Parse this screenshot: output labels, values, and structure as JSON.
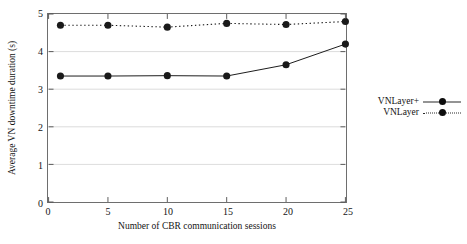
{
  "chart_data": {
    "type": "line",
    "title": "",
    "xlabel": "Number of CBR communication sessions",
    "ylabel": "Average VN downtime duration (s)",
    "x": [
      1,
      5,
      10,
      15,
      20,
      25
    ],
    "xlim": [
      0,
      25
    ],
    "ylim": [
      0,
      5
    ],
    "xticks": [
      "0",
      "5",
      "10",
      "15",
      "20",
      "25"
    ],
    "xtick_values": [
      0,
      5,
      10,
      15,
      20,
      25
    ],
    "yticks": [
      "0",
      "1",
      "2",
      "3",
      "4",
      "5"
    ],
    "ytick_values": [
      0,
      1,
      2,
      3,
      4,
      5
    ],
    "grid": "horizontal",
    "legend_position": "right-outside",
    "series": [
      {
        "name": "VNLayer+",
        "style": "solid",
        "marker": "filled-circle",
        "color": "#1a1a1a",
        "values": [
          3.35,
          3.35,
          3.36,
          3.35,
          3.65,
          4.2
        ]
      },
      {
        "name": "VNLayer",
        "style": "dotted",
        "marker": "filled-circle",
        "color": "#1a1a1a",
        "values": [
          4.7,
          4.7,
          4.65,
          4.75,
          4.72,
          4.8
        ]
      }
    ]
  }
}
